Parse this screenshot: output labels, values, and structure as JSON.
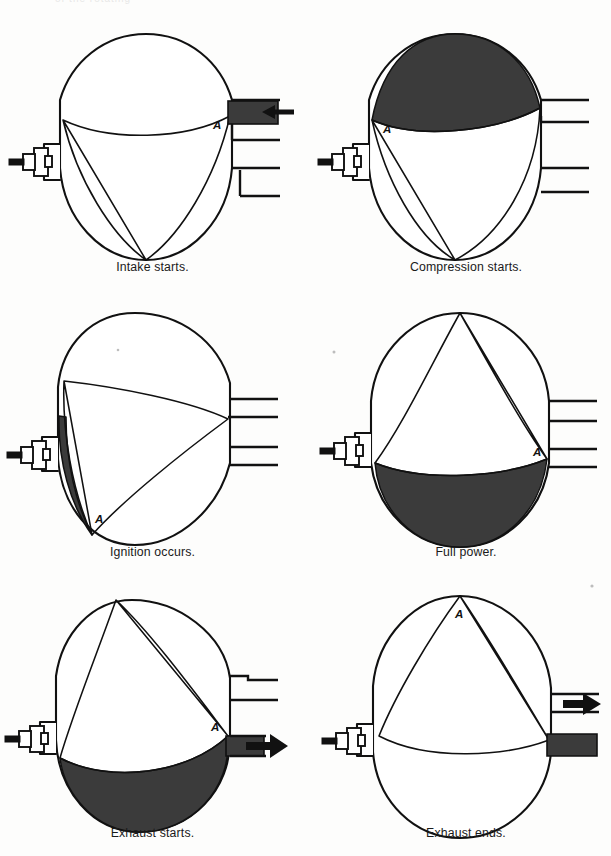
{
  "page": {
    "background_color": "#fdfdfc",
    "ink_color": "#111111",
    "chamber_fill_color": "#3b3b3b",
    "top_cut_text": "of the rotating"
  },
  "diagram": {
    "type": "process-cycle",
    "rotor_apex_label": "A",
    "panel_count": 6,
    "columns": 2,
    "rows": 3
  },
  "panels": [
    {
      "index": 1,
      "id": "intake-starts",
      "caption": "Intake starts.",
      "apex_label": "A",
      "apex_label_position": "upper-right",
      "chamber_filled": false,
      "intake_port_filled": true,
      "exhaust_port_filled": false,
      "arrow": {
        "present": true,
        "direction": "left",
        "at": "intake-port",
        "meaning": "fresh charge entering"
      },
      "rotor_rotation_deg": 0
    },
    {
      "index": 2,
      "id": "compression-starts",
      "caption": "Compression starts.",
      "apex_label": "A",
      "apex_label_position": "left",
      "chamber_filled": true,
      "chamber_fill_region": "top",
      "intake_port_filled": false,
      "exhaust_port_filled": false,
      "arrow": {
        "present": false
      },
      "rotor_rotation_deg": 60
    },
    {
      "index": 3,
      "id": "ignition-occurs",
      "caption": "Ignition occurs.",
      "apex_label": "A",
      "apex_label_position": "lower-left",
      "chamber_filled": true,
      "chamber_fill_region": "left-crescent",
      "intake_port_filled": false,
      "exhaust_port_filled": false,
      "arrow": {
        "present": false
      },
      "rotor_rotation_deg": 120
    },
    {
      "index": 4,
      "id": "full-power",
      "caption": "Full power.",
      "apex_label": "A",
      "apex_label_position": "right",
      "chamber_filled": true,
      "chamber_fill_region": "bottom",
      "intake_port_filled": false,
      "exhaust_port_filled": false,
      "arrow": {
        "present": false
      },
      "rotor_rotation_deg": 180
    },
    {
      "index": 5,
      "id": "exhaust-starts",
      "caption": "Exhaust starts.",
      "apex_label": "A",
      "apex_label_position": "right",
      "chamber_filled": true,
      "chamber_fill_region": "bottom",
      "intake_port_filled": false,
      "exhaust_port_filled": true,
      "arrow": {
        "present": true,
        "direction": "right",
        "at": "exhaust-port",
        "meaning": "burnt gas leaving"
      },
      "rotor_rotation_deg": 240
    },
    {
      "index": 6,
      "id": "exhaust-ends",
      "caption": "Exhaust ends.",
      "apex_label": "A",
      "apex_label_position": "top",
      "chamber_filled": false,
      "intake_port_filled": false,
      "exhaust_port_filled": true,
      "arrow": {
        "present": true,
        "direction": "right",
        "at": "upper-exhaust-port",
        "meaning": "last of burnt gas leaving"
      },
      "rotor_rotation_deg": 300
    }
  ],
  "components": {
    "housing": "epitrochoid-housing",
    "rotor": "triangular-rotor",
    "spark_plug": "spark-plug",
    "intake_port": "intake-port",
    "exhaust_port": "exhaust-port"
  }
}
